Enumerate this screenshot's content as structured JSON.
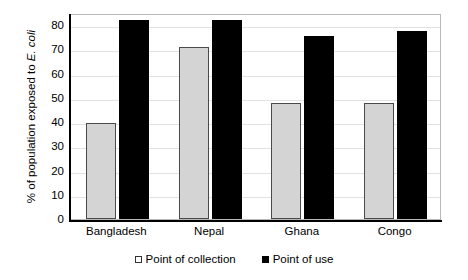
{
  "chart_data": {
    "type": "bar",
    "title": "",
    "xlabel": "",
    "ylabel": "% of population exposed to E. coli",
    "ylabel_plain": "% of population exposed to",
    "ylabel_italic": "E. coli",
    "categories": [
      "Bangladesh",
      "Nepal",
      "Ghana",
      "Congo"
    ],
    "series": [
      {
        "name": "Point of collection",
        "values": [
          39.5,
          71,
          48,
          48
        ],
        "color": "#d4d4d4"
      },
      {
        "name": "Point of use",
        "values": [
          82,
          82,
          75.5,
          77.5
        ],
        "color": "#000000"
      }
    ],
    "ylim": [
      0,
      85
    ],
    "yticks": [
      80,
      70,
      60,
      50,
      40,
      30,
      20,
      10,
      0
    ],
    "grid": true,
    "legend_position": "bottom"
  },
  "legend": {
    "items": [
      {
        "label": "Point of collection",
        "marker": "open-square-marker"
      },
      {
        "label": "Point of use",
        "marker": "filled-square-marker"
      }
    ]
  }
}
